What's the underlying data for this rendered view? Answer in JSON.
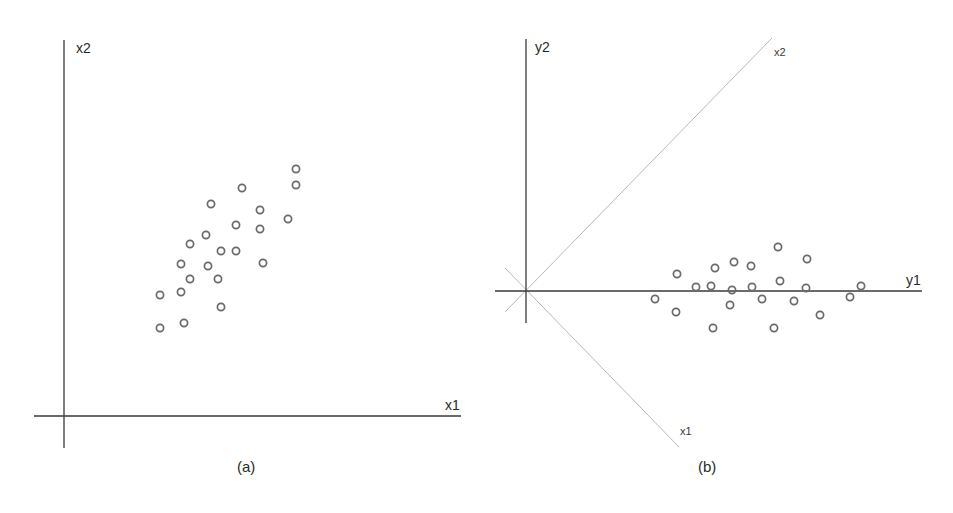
{
  "panels": {
    "a": {
      "caption": "(a)",
      "x_axis_label": "x1",
      "y_axis_label": "x2"
    },
    "b": {
      "caption": "(b)",
      "x_axis_label": "y1",
      "y_axis_label": "y2",
      "rotated_axis_labels": {
        "x1": "x1",
        "x2": "x2"
      }
    }
  },
  "colors": {
    "axis": "#3a3a3a",
    "rotated_axis": "#b8b8b8",
    "marker": "#6a6a6a",
    "background": "#ffffff"
  },
  "chart_data": [
    {
      "type": "scatter",
      "title": "(a)",
      "xlabel": "x1",
      "ylabel": "x2",
      "grid": false,
      "legend": null,
      "marker": "open-circle",
      "note": "Correlated 2D data in original coordinates (pixel-relative units from origin, y up)",
      "points": [
        [
          96,
          88
        ],
        [
          120,
          93
        ],
        [
          96,
          121
        ],
        [
          117,
          124
        ],
        [
          126,
          137
        ],
        [
          154,
          137
        ],
        [
          117,
          152
        ],
        [
          144,
          150
        ],
        [
          157,
          109
        ],
        [
          126,
          172
        ],
        [
          142,
          181
        ],
        [
          157,
          165
        ],
        [
          172,
          165
        ],
        [
          172,
          191
        ],
        [
          147,
          212
        ],
        [
          178,
          228
        ],
        [
          196,
          206
        ],
        [
          196,
          187
        ],
        [
          199,
          153
        ],
        [
          224,
          197
        ],
        [
          232,
          231
        ],
        [
          232,
          247
        ]
      ]
    },
    {
      "type": "scatter",
      "title": "(b)",
      "xlabel": "y1",
      "ylabel": "y2",
      "grid": false,
      "legend": null,
      "marker": "open-circle",
      "note": "Same data in rotated (principal-component) coordinates; original x1/x2 axes drawn as light diagonal lines",
      "points": [
        [
          129,
          -8
        ],
        [
          151,
          17
        ],
        [
          150,
          -21
        ],
        [
          170,
          4
        ],
        [
          185,
          5
        ],
        [
          189,
          23
        ],
        [
          187,
          -37
        ],
        [
          208,
          29
        ],
        [
          206,
          1
        ],
        [
          204,
          -14
        ],
        [
          225,
          25
        ],
        [
          226,
          4
        ],
        [
          236,
          -8
        ],
        [
          252,
          44
        ],
        [
          254,
          10
        ],
        [
          248,
          -37
        ],
        [
          268,
          -10
        ],
        [
          281,
          32
        ],
        [
          280,
          3
        ],
        [
          294,
          -24
        ],
        [
          324,
          -6
        ],
        [
          335,
          5
        ]
      ]
    }
  ]
}
